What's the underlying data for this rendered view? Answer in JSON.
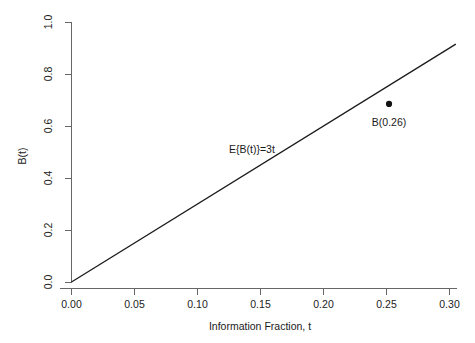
{
  "chart_data": {
    "type": "line",
    "title": "",
    "xlabel": "Information Fraction, t",
    "ylabel": "B(t)",
    "xlim": [
      -0.005,
      0.315
    ],
    "ylim": [
      -0.02,
      1.02
    ],
    "grid": false,
    "legend": null,
    "x_ticks": [
      0.0,
      0.05,
      0.1,
      0.15,
      0.2,
      0.25,
      0.3
    ],
    "x_tick_labels": [
      "0.00",
      "0.05",
      "0.10",
      "0.15",
      "0.20",
      "0.25",
      "0.30"
    ],
    "y_ticks": [
      0.0,
      0.2,
      0.4,
      0.6,
      0.8,
      1.0
    ],
    "y_tick_labels": [
      "0.0",
      "0.2",
      "0.4",
      "0.6",
      "0.8",
      "1.0"
    ],
    "series": [
      {
        "name": "E{B(t)}=3t",
        "type": "line",
        "slope": 3,
        "intercept": 0,
        "x": [
          0.0,
          0.305
        ],
        "values": [
          0.0,
          0.915
        ],
        "color": "#1c1c1c"
      },
      {
        "name": "B(0.26)",
        "type": "scatter",
        "x": [
          0.252
        ],
        "values": [
          0.685
        ],
        "color": "#131313"
      }
    ],
    "annotations": [
      {
        "text": "E{B(t)}=3t",
        "x": 0.125,
        "y": 0.495
      },
      {
        "text": "B(0.26)",
        "x": 0.252,
        "y": 0.6
      }
    ]
  },
  "axes": {
    "x_title": "Information Fraction, t",
    "y_title": "B(t)",
    "x_tick_labels": [
      "0.00",
      "0.05",
      "0.10",
      "0.15",
      "0.20",
      "0.25",
      "0.30"
    ],
    "y_tick_labels": [
      "0.0",
      "0.2",
      "0.4",
      "0.6",
      "0.8",
      "1.0"
    ]
  },
  "labels": {
    "expectation_annotation": "E{B(t)}=3t",
    "point_annotation": "B(0.26)"
  },
  "colors": {
    "line": "#1c1c1c",
    "point": "#131313",
    "axis": "#666666",
    "background": "#ffffff",
    "text": "#1a1a1a"
  }
}
